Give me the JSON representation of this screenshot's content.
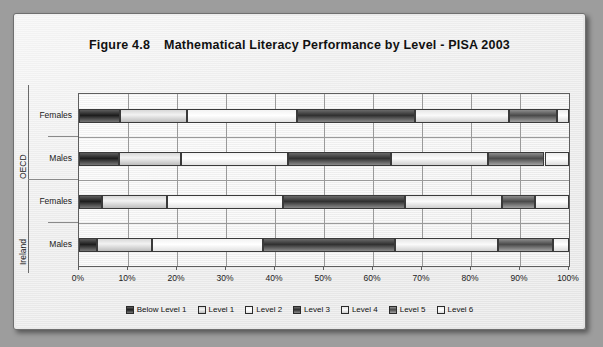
{
  "figure": {
    "number": "Figure 4.8",
    "title": "Mathematical Literacy Performance by Level - PISA 2003"
  },
  "chart_data": {
    "type": "bar",
    "orientation": "horizontal",
    "stacked": true,
    "stack_mode": "percent",
    "title": "Mathematical Literacy Performance by Level - PISA 2003",
    "xlabel": "",
    "ylabel": "",
    "xlim": [
      0,
      100
    ],
    "xtick_labels": [
      "0%",
      "10%",
      "20%",
      "30%",
      "40%",
      "50%",
      "60%",
      "70%",
      "80%",
      "90%",
      "100%"
    ],
    "xticks": [
      0,
      10,
      20,
      30,
      40,
      50,
      60,
      70,
      80,
      90,
      100
    ],
    "grid": "vertical",
    "legend_position": "bottom",
    "groups": [
      "OECD",
      "Ireland"
    ],
    "categories": [
      "Females",
      "Males",
      "Females",
      "Males"
    ],
    "category_groups": [
      "OECD",
      "OECD",
      "Ireland",
      "Ireland"
    ],
    "series": [
      {
        "name": "Below Level 1",
        "fill": "lv-b1",
        "values": [
          8.4,
          8.2,
          4.7,
          3.7
        ]
      },
      {
        "name": "Level 1",
        "fill": "lv-1",
        "values": [
          13.6,
          12.6,
          13.3,
          11.2
        ]
      },
      {
        "name": "Level 2",
        "fill": "lv-2",
        "values": [
          22.5,
          21.8,
          23.7,
          22.6
        ]
      },
      {
        "name": "Level 3",
        "fill": "lv-3",
        "values": [
          24.1,
          21.0,
          24.9,
          27.0
        ]
      },
      {
        "name": "Level 4",
        "fill": "lv-4",
        "values": [
          19.2,
          19.8,
          19.8,
          21.0
        ]
      },
      {
        "name": "Level 5",
        "fill": "lv-5",
        "values": [
          9.8,
          11.6,
          6.7,
          11.2
        ]
      },
      {
        "name": "Level 6",
        "fill": "lv-6",
        "values": [
          2.4,
          5.0,
          6.9,
          3.3
        ]
      }
    ]
  },
  "legend": {
    "items": [
      {
        "label": "Below Level 1"
      },
      {
        "label": "Level 1"
      },
      {
        "label": "Level 2"
      },
      {
        "label": "Level 3"
      },
      {
        "label": "Level 4"
      },
      {
        "label": "Level 5"
      },
      {
        "label": "Level 6"
      }
    ]
  }
}
